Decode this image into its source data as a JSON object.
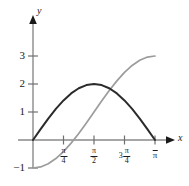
{
  "chart_data": {
    "type": "line",
    "title": "",
    "xlabel": "x",
    "ylabel": "y",
    "xlim": [
      0,
      3.141592653589793
    ],
    "ylim": [
      -1,
      3.4
    ],
    "grid": false,
    "legend": "none",
    "x_tick_labels": [
      "π/4",
      "π/2",
      "3π/4",
      "π"
    ],
    "x_tick_values": [
      0.7853981634,
      1.5707963268,
      2.3561944902,
      3.1415926536
    ],
    "y_tick_labels": [
      "-1",
      "1",
      "2",
      "3"
    ],
    "y_tick_values": [
      -1,
      1,
      2,
      3
    ],
    "series": [
      {
        "name": "dark-curve",
        "expression": "2 sin(x)",
        "color": "#2b2b2b",
        "x": [
          0,
          0.19634954,
          0.39269908,
          0.58904862,
          0.78539816,
          0.9817477,
          1.17809725,
          1.37444679,
          1.57079633,
          1.76714587,
          1.96349541,
          2.15984495,
          2.35619449,
          2.55254403,
          2.74889357,
          2.94524311,
          3.14159265
        ],
        "y": [
          0,
          0.39018064,
          0.76536686,
          1.11114047,
          1.41421356,
          1.66293922,
          1.84775907,
          1.96157056,
          2.0,
          1.96157056,
          1.84775907,
          1.66293922,
          1.41421356,
          1.11114047,
          0.76536686,
          0.39018064,
          0
        ]
      },
      {
        "name": "gray-curve",
        "expression": "1 - 2 cos(x)",
        "color": "#9c9c9c",
        "x": [
          0,
          0.19634954,
          0.39269908,
          0.58904862,
          0.78539816,
          0.9817477,
          1.17809725,
          1.37444679,
          1.57079633,
          1.76714587,
          1.96349541,
          2.15984495,
          2.35619449,
          2.55254403,
          2.74889357,
          2.94524311,
          3.14159265
        ],
        "y": [
          -1.0,
          -0.96157056,
          -0.84775907,
          -0.66293922,
          -0.41421356,
          -0.11114047,
          0.23463314,
          0.60981936,
          1.0,
          1.39018064,
          1.76536686,
          2.11114047,
          2.41421356,
          2.66293922,
          2.84775907,
          2.96157056,
          3.0
        ]
      }
    ]
  },
  "axis": {
    "x_name": "x",
    "y_name": "y"
  },
  "y_ticks": [
    {
      "label": "3"
    },
    {
      "label": "2"
    },
    {
      "label": "1"
    },
    {
      "label": "−1"
    }
  ],
  "x_ticks": [
    {
      "numerator": "π",
      "denominator": "4",
      "lead": ""
    },
    {
      "numerator": "π",
      "denominator": "2",
      "lead": ""
    },
    {
      "numerator": "π",
      "denominator": "4",
      "lead": "3"
    },
    {
      "plain": "π"
    }
  ]
}
